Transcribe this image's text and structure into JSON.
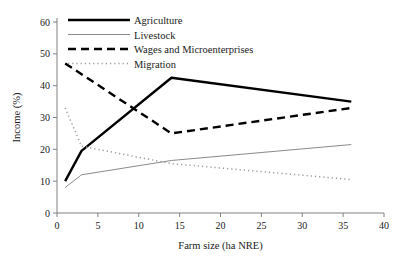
{
  "chart_data": {
    "type": "line",
    "title": "",
    "xlabel": "Farm size (ha NRE)",
    "ylabel": "Income (%)",
    "xlim": [
      0,
      40
    ],
    "ylim": [
      0,
      60
    ],
    "xticks": [
      "0",
      "5",
      "10",
      "15",
      "20",
      "25",
      "30",
      "35",
      "40"
    ],
    "yticks": [
      "0",
      "10",
      "20",
      "30",
      "40",
      "50",
      "60"
    ],
    "grid": false,
    "legend_position": "top-left-inside",
    "series": [
      {
        "name": "Agriculture",
        "style": "solid-thick",
        "color": "#000000",
        "x": [
          1,
          3,
          14,
          36
        ],
        "values": [
          10,
          19.5,
          42.5,
          35
        ]
      },
      {
        "name": "Livestock",
        "style": "solid-thin",
        "color": "#7d7d7d",
        "x": [
          1,
          3,
          14,
          36
        ],
        "values": [
          8,
          12,
          16.5,
          21.5
        ]
      },
      {
        "name": "Wages and Microenterprises",
        "style": "dashed-thick",
        "color": "#000000",
        "x": [
          1,
          14,
          36
        ],
        "values": [
          47,
          25,
          33
        ]
      },
      {
        "name": "Migration",
        "style": "dotted",
        "color": "#9a9a9a",
        "x": [
          1,
          3,
          14,
          36
        ],
        "values": [
          33,
          21,
          15.5,
          10.5
        ]
      }
    ]
  },
  "legend": {
    "items": [
      {
        "label": "Agriculture"
      },
      {
        "label": "Livestock"
      },
      {
        "label": "Wages and Microenterprises"
      },
      {
        "label": "Migration"
      }
    ]
  }
}
